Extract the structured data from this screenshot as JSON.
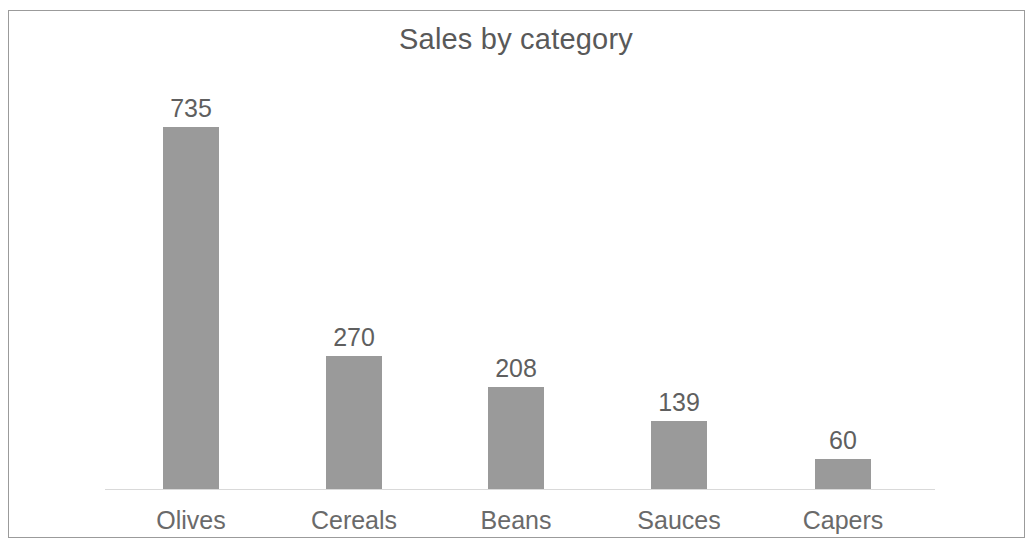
{
  "chart_data": {
    "type": "bar",
    "title": "Sales by category",
    "subtitle": "",
    "xlabel": "",
    "ylabel": "",
    "categories": [
      "Olives",
      "Cereals",
      "Beans",
      "Sauces",
      "Capers"
    ],
    "values": [
      735,
      270,
      208,
      139,
      60
    ],
    "data_labels": [
      "735",
      "270",
      "208",
      "139",
      "60"
    ],
    "series": [
      {
        "name": "Sales",
        "values": [
          735,
          270,
          208,
          139,
          60
        ],
        "color": "#9a9a9a"
      }
    ],
    "ylim": [
      0,
      735
    ],
    "grid": false,
    "legend": false,
    "legend_position": "none",
    "axis": {
      "category_axis_visible": true,
      "value_axis_visible": false,
      "tick_labels_visible": false,
      "axis_line_color": "#d9d9d9"
    },
    "data_labels_visible": true,
    "annotations": []
  },
  "style": {
    "background_color": "#ffffff",
    "border_color": "#9b9b9b",
    "bar_color": "#9a9a9a",
    "title_color": "#595959",
    "label_color": "#6a6a6a",
    "value_label_color": "#5f5f5f"
  },
  "bars": [
    {
      "label": "Olives",
      "value_text": "735",
      "value": 735
    },
    {
      "label": "Cereals",
      "value_text": "270",
      "value": 270
    },
    {
      "label": "Beans",
      "value_text": "208",
      "value": 208
    },
    {
      "label": "Sauces",
      "value_text": "139",
      "value": 139
    },
    {
      "label": "Capers",
      "value_text": "60",
      "value": 60
    }
  ]
}
